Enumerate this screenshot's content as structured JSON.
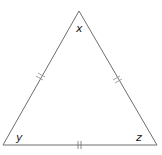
{
  "diagram": {
    "type": "isosceles/equilateral triangle with congruence tick marks",
    "stroke_color": "#6e6e6e",
    "vertices": {
      "top": {
        "label": "x",
        "x": 79,
        "y": 11
      },
      "bottom_left": {
        "label": "y",
        "x": 3,
        "y": 145
      },
      "bottom_right": {
        "label": "z",
        "x": 157,
        "y": 145
      }
    },
    "labels": {
      "top": "x",
      "left": "y",
      "right": "z"
    },
    "tick_marks": {
      "left_side": 2,
      "right_side": 2,
      "base": 2
    }
  }
}
